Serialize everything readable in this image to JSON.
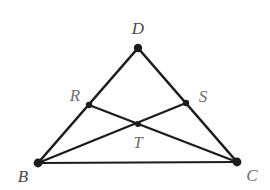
{
  "figure": {
    "background_color": "#ffffff",
    "stroke_color": "#1c1c1c",
    "label_color": "#6d6d6d",
    "canvas": {
      "width": 270,
      "height": 190
    }
  },
  "points": [
    {
      "id": "D",
      "label": "D",
      "x": 138,
      "y": 48,
      "label_x": 138,
      "label_y": 28,
      "dot_radius": 4.2
    },
    {
      "id": "R",
      "label": "R",
      "x": 89,
      "y": 105,
      "label_x": 75,
      "label_y": 95,
      "dot_radius": 3.2
    },
    {
      "id": "S",
      "label": "S",
      "x": 186,
      "y": 103,
      "label_x": 203,
      "label_y": 96,
      "dot_radius": 3.2
    },
    {
      "id": "T",
      "label": "T",
      "x": 138,
      "y": 124,
      "label_x": 138,
      "label_y": 142,
      "dot_radius": 3.0
    },
    {
      "id": "B",
      "label": "B",
      "x": 38,
      "y": 163,
      "label_x": 23,
      "label_y": 176,
      "dot_radius": 4.4
    },
    {
      "id": "C",
      "label": "C",
      "x": 237,
      "y": 162,
      "label_x": 252,
      "label_y": 175,
      "dot_radius": 4.4
    }
  ],
  "segments": [
    {
      "id": "BD",
      "from": "B",
      "to": "D",
      "width": 2.6
    },
    {
      "id": "DC",
      "from": "D",
      "to": "C",
      "width": 2.6
    },
    {
      "id": "BC",
      "from": "B",
      "to": "C",
      "width": 2.2
    },
    {
      "id": "BS",
      "from": "B",
      "to": "S",
      "width": 2.4
    },
    {
      "id": "RC",
      "from": "R",
      "to": "C",
      "width": 2.4
    }
  ]
}
